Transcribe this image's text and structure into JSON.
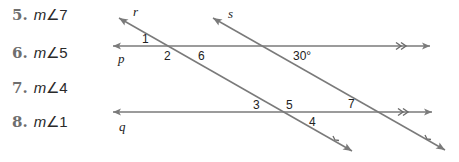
{
  "problems": [
    {
      "number": "5.",
      "m": "m",
      "angle": "∠7"
    },
    {
      "number": "6.",
      "m": "m",
      "angle": "∠5"
    },
    {
      "number": "7.",
      "m": "m",
      "angle": "∠4"
    },
    {
      "number": "8.",
      "m": "m",
      "angle": "∠1"
    }
  ],
  "figure": {
    "line_color": "#7a7a7a",
    "lines": {
      "p": {
        "label": "p"
      },
      "q": {
        "label": "q"
      },
      "r": {
        "label": "r"
      },
      "s": {
        "label": "s"
      }
    },
    "angle_labels": {
      "a1": "1",
      "a2": "2",
      "a6": "6",
      "a30": "30°",
      "a3": "3",
      "a5": "5",
      "a7": "7",
      "a4": "4"
    },
    "parallel_marks": ">>"
  }
}
